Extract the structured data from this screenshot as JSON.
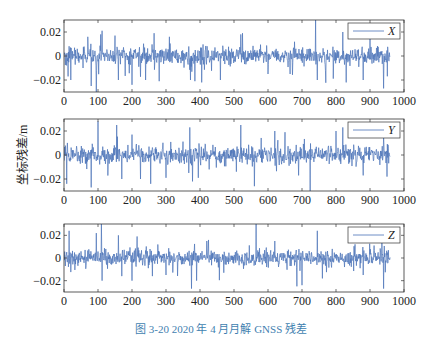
{
  "figure": {
    "caption": "图 3-20   2020 年 4 月月解 GNSS 残差",
    "ylabel": "坐标残差/m",
    "line_color": "#4a72b8"
  },
  "chart_data": [
    {
      "type": "line",
      "title": "",
      "legend": [
        "X"
      ],
      "legend_position": "upper right",
      "xlabel": "",
      "ylabel": "坐标残差/m",
      "xlim": [
        0,
        1000
      ],
      "ylim": [
        -0.03,
        0.03
      ],
      "xticks": [
        0,
        100,
        200,
        300,
        400,
        500,
        600,
        700,
        800,
        900,
        1000
      ],
      "yticks": [
        -0.02,
        0,
        0.02
      ],
      "ytick_labels": [
        "−0.02",
        "0",
        "0.02"
      ],
      "grid": false,
      "n_points": 960,
      "series": [
        {
          "name": "X",
          "description": "noisy residuals around 0, mostly within ±0.01, spikes to about ±0.03 (e.g. ~-0.03 near x=95, +0.03 near x=740, -0.025 near x=940)"
        }
      ]
    },
    {
      "type": "line",
      "legend": [
        "Y"
      ],
      "legend_position": "upper right",
      "xlim": [
        0,
        1000
      ],
      "ylim": [
        -0.03,
        0.03
      ],
      "xticks": [
        0,
        100,
        200,
        300,
        400,
        500,
        600,
        700,
        800,
        900,
        1000
      ],
      "yticks": [
        -0.02,
        0,
        0.02
      ],
      "ytick_labels": [
        "−0.02",
        "0",
        "0.02"
      ],
      "grid": false,
      "n_points": 960,
      "series": [
        {
          "name": "Y",
          "description": "noisy residuals around 0, spikes up to ~+0.028 near x=100 and x=380, down to ~-0.028 near x=80 and x=560"
        }
      ]
    },
    {
      "type": "line",
      "legend": [
        "Z"
      ],
      "legend_position": "upper right",
      "xlim": [
        0,
        1000
      ],
      "ylim": [
        -0.03,
        0.03
      ],
      "xticks": [
        0,
        100,
        200,
        300,
        400,
        500,
        600,
        700,
        800,
        900,
        1000
      ],
      "yticks": [
        -0.02,
        0,
        0.02
      ],
      "ytick_labels": [
        "−0.02",
        "0",
        "0.02"
      ],
      "grid": false,
      "n_points": 960,
      "series": [
        {
          "name": "Z",
          "description": "noisy residuals around 0, spikes up to ~+0.03 near x=110 and x=565, down to ~-0.027 near x=375 and x=685"
        }
      ]
    }
  ]
}
